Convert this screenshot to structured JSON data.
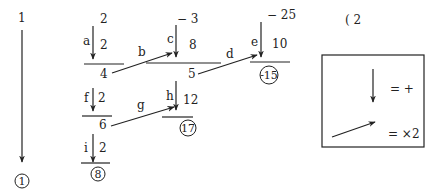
{
  "diagram": {
    "colors": {
      "ink": "#222222",
      "background": "#ffffff"
    },
    "start_column": {
      "top_value": "1",
      "result": "1"
    },
    "column_1": {
      "block_a": {
        "top": "2",
        "label": "a",
        "addend": "2",
        "sum": "4"
      },
      "block_f": {
        "label": "f",
        "addend": "2",
        "sum": "6"
      },
      "block_i": {
        "label": "i",
        "addend": "2",
        "result": "8"
      }
    },
    "column_2": {
      "block_c": {
        "top": "− 3",
        "label": "c",
        "addend": "8",
        "sum": "5"
      },
      "block_h": {
        "label": "h",
        "addend": "12",
        "result": "17"
      }
    },
    "column_3": {
      "block_e": {
        "top": "− 25",
        "label": "e",
        "addend": "10",
        "result": "-15"
      }
    },
    "diagonal_labels": {
      "b": "b",
      "d": "d",
      "g": "g"
    },
    "stray_mark": "( 2",
    "legend": {
      "down_arrow_meaning": "= +",
      "diagonal_arrow_meaning": "= ×2"
    }
  }
}
